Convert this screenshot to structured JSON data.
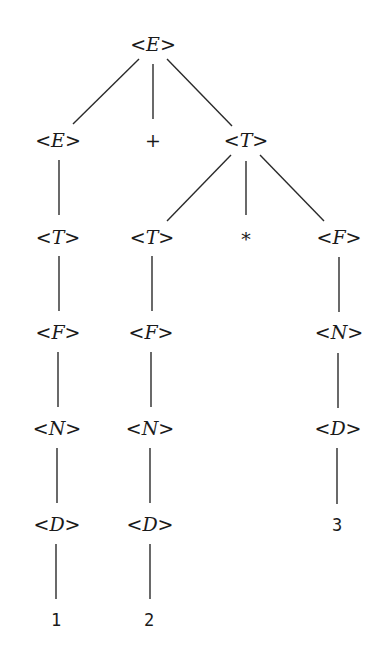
{
  "diagram": {
    "type": "parse-tree",
    "expression": "1 + 2 * 3",
    "colors": {
      "background": "#ffffff",
      "ink": "#1a1a1a",
      "edge": "#2a2a2a"
    },
    "nodes": [
      {
        "id": "n0",
        "kind": "nonterminal",
        "label": "E",
        "x": 153,
        "y": 44
      },
      {
        "id": "n1",
        "kind": "nonterminal",
        "label": "E",
        "x": 58,
        "y": 140
      },
      {
        "id": "n2",
        "kind": "terminal",
        "label": "+",
        "x": 153,
        "y": 140
      },
      {
        "id": "n3",
        "kind": "nonterminal",
        "label": "T",
        "x": 246,
        "y": 140
      },
      {
        "id": "n4",
        "kind": "nonterminal",
        "label": "T",
        "x": 58,
        "y": 237
      },
      {
        "id": "n5",
        "kind": "nonterminal",
        "label": "T",
        "x": 152,
        "y": 237
      },
      {
        "id": "n6",
        "kind": "terminal",
        "label": "*",
        "x": 246,
        "y": 239
      },
      {
        "id": "n7",
        "kind": "nonterminal",
        "label": "F",
        "x": 339,
        "y": 237
      },
      {
        "id": "n8",
        "kind": "nonterminal",
        "label": "F",
        "x": 58,
        "y": 332
      },
      {
        "id": "n9",
        "kind": "nonterminal",
        "label": "F",
        "x": 151,
        "y": 332
      },
      {
        "id": "n10",
        "kind": "nonterminal",
        "label": "N",
        "x": 339,
        "y": 332
      },
      {
        "id": "n11",
        "kind": "nonterminal",
        "label": "N",
        "x": 57,
        "y": 428
      },
      {
        "id": "n12",
        "kind": "nonterminal",
        "label": "N",
        "x": 150,
        "y": 428
      },
      {
        "id": "n13",
        "kind": "nonterminal",
        "label": "D",
        "x": 338,
        "y": 428
      },
      {
        "id": "n14",
        "kind": "nonterminal",
        "label": "D",
        "x": 57,
        "y": 524
      },
      {
        "id": "n15",
        "kind": "nonterminal",
        "label": "D",
        "x": 150,
        "y": 524
      },
      {
        "id": "n16",
        "kind": "leaf",
        "label": "3",
        "x": 337,
        "y": 525
      },
      {
        "id": "n17",
        "kind": "leaf",
        "label": "1",
        "x": 56,
        "y": 620
      },
      {
        "id": "n18",
        "kind": "leaf",
        "label": "2",
        "x": 149,
        "y": 620
      }
    ],
    "edges": [
      {
        "from": "n0",
        "to": "n1",
        "x1": 139,
        "y1": 59,
        "x2": 73,
        "y2": 124
      },
      {
        "from": "n0",
        "to": "n2",
        "x1": 153,
        "y1": 64,
        "x2": 153,
        "y2": 119
      },
      {
        "from": "n0",
        "to": "n3",
        "x1": 167,
        "y1": 59,
        "x2": 232,
        "y2": 126
      },
      {
        "from": "n1",
        "to": "n4",
        "x1": 59,
        "y1": 160,
        "x2": 59,
        "y2": 215
      },
      {
        "from": "n3",
        "to": "n5",
        "x1": 231,
        "y1": 155,
        "x2": 167,
        "y2": 221
      },
      {
        "from": "n3",
        "to": "n6",
        "x1": 246,
        "y1": 161,
        "x2": 246,
        "y2": 215
      },
      {
        "from": "n3",
        "to": "n7",
        "x1": 260,
        "y1": 155,
        "x2": 324,
        "y2": 221
      },
      {
        "from": "n4",
        "to": "n8",
        "x1": 59,
        "y1": 256,
        "x2": 59,
        "y2": 311
      },
      {
        "from": "n5",
        "to": "n9",
        "x1": 152,
        "y1": 256,
        "x2": 152,
        "y2": 311
      },
      {
        "from": "n7",
        "to": "n10",
        "x1": 339,
        "y1": 257,
        "x2": 339,
        "y2": 312
      },
      {
        "from": "n8",
        "to": "n11",
        "x1": 58,
        "y1": 352,
        "x2": 58,
        "y2": 407
      },
      {
        "from": "n9",
        "to": "n12",
        "x1": 151,
        "y1": 352,
        "x2": 151,
        "y2": 407
      },
      {
        "from": "n10",
        "to": "n13",
        "x1": 338,
        "y1": 353,
        "x2": 338,
        "y2": 408
      },
      {
        "from": "n11",
        "to": "n14",
        "x1": 57,
        "y1": 448,
        "x2": 57,
        "y2": 503
      },
      {
        "from": "n12",
        "to": "n15",
        "x1": 150,
        "y1": 448,
        "x2": 150,
        "y2": 503
      },
      {
        "from": "n13",
        "to": "n16",
        "x1": 337,
        "y1": 448,
        "x2": 337,
        "y2": 504
      },
      {
        "from": "n14",
        "to": "n17",
        "x1": 56,
        "y1": 544,
        "x2": 56,
        "y2": 599
      },
      {
        "from": "n15",
        "to": "n18",
        "x1": 150,
        "y1": 544,
        "x2": 150,
        "y2": 599
      }
    ]
  }
}
